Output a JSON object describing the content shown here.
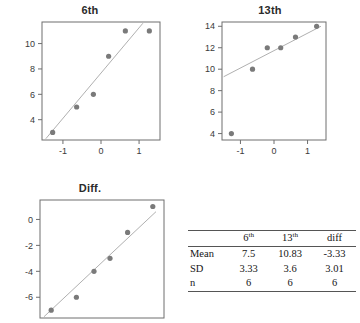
{
  "figure": {
    "background": "#ffffff",
    "point_color": "#7a7a7a",
    "line_color": "#b0b0b0",
    "axis_color": "#6e6e6e"
  },
  "panels": {
    "sixth": {
      "title": "6th"
    },
    "thirteenth": {
      "title": "13th"
    },
    "diff": {
      "title": "Diff."
    }
  },
  "chart_data": [
    {
      "type": "scatter",
      "title": "6th",
      "xlabel": "",
      "ylabel": "",
      "grid": false,
      "legend": null,
      "xlim": [
        -1.55,
        1.55
      ],
      "ylim": [
        2.4,
        11.7
      ],
      "xticks": [
        -1,
        0,
        1
      ],
      "xticklabels": [
        "-1",
        "0",
        "1"
      ],
      "yticks": [
        4,
        6,
        8,
        10
      ],
      "yticklabels": [
        "4",
        "6",
        "8",
        "10"
      ],
      "x": [
        -1.27,
        -0.64,
        -0.2,
        0.2,
        0.64,
        1.27
      ],
      "y": [
        3,
        5,
        6,
        9,
        11,
        11
      ],
      "fit_line": {
        "x": [
          -1.45,
          1.1
        ],
        "y": [
          2.5,
          11.6
        ]
      }
    },
    {
      "type": "scatter",
      "title": "13th",
      "xlabel": "",
      "ylabel": "",
      "grid": false,
      "legend": null,
      "xlim": [
        -1.55,
        1.55
      ],
      "ylim": [
        3.4,
        14.4
      ],
      "xticks": [
        -1,
        0,
        1
      ],
      "xticklabels": [
        "-1",
        "0",
        "1"
      ],
      "yticks": [
        4,
        6,
        8,
        10,
        12,
        14
      ],
      "yticklabels": [
        "4",
        "6",
        "8",
        "10",
        "12",
        "14"
      ],
      "x": [
        -1.27,
        -0.64,
        -0.2,
        0.2,
        0.64,
        1.27
      ],
      "y": [
        4,
        10,
        12,
        12,
        13,
        14
      ],
      "fit_line": {
        "x": [
          -1.5,
          1.4
        ],
        "y": [
          9.3,
          14.0
        ]
      }
    },
    {
      "type": "scatter",
      "title": "Diff.",
      "xlabel": "",
      "ylabel": "",
      "grid": false,
      "legend": null,
      "xlim": [
        -1.55,
        1.55
      ],
      "ylim": [
        -7.6,
        1.5
      ],
      "xticks": [],
      "xticklabels": [],
      "yticks": [
        -6,
        -4,
        -2,
        0
      ],
      "yticklabels": [
        "-6",
        "-4",
        "-2",
        "0"
      ],
      "x": [
        -1.27,
        -0.64,
        -0.2,
        0.2,
        0.64,
        1.27
      ],
      "y": [
        -7,
        -6,
        -4,
        -3,
        -1,
        1
      ],
      "fit_line": {
        "x": [
          -1.45,
          1.35
        ],
        "y": [
          -7.5,
          0.6
        ]
      }
    },
    {
      "type": "table",
      "title": "",
      "columns": [
        "",
        "6th",
        "13th",
        "diff"
      ],
      "rows": [
        [
          "Mean",
          "7.5",
          "10.83",
          "-3.33"
        ],
        [
          "SD",
          "3.33",
          "3.6",
          "3.01"
        ],
        [
          "n",
          "6",
          "6",
          "6"
        ]
      ]
    }
  ],
  "stats_table": {
    "headers": {
      "corner": "",
      "col1_base": "6",
      "col1_sup": "th",
      "col2_base": "13",
      "col2_sup": "th",
      "col3": "diff"
    },
    "rows": [
      {
        "label": "Mean",
        "sixth": "7.5",
        "thirteenth": "10.83",
        "diff": "-3.33"
      },
      {
        "label": "SD",
        "sixth": "3.33",
        "thirteenth": "3.6",
        "diff": "3.01"
      },
      {
        "label": "n",
        "sixth": "6",
        "thirteenth": "6",
        "diff": "6"
      }
    ]
  }
}
